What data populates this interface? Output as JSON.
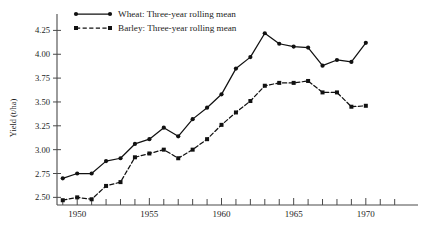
{
  "chart_data": {
    "type": "line",
    "title": "",
    "xlabel": "",
    "ylabel": "Yield (t/ha)",
    "xlim": [
      1948.6,
      1973.2
    ],
    "ylim": [
      2.42,
      4.38
    ],
    "grid": false,
    "legend_position": "top-left",
    "x": [
      1949,
      1950,
      1951,
      1952,
      1953,
      1954,
      1955,
      1956,
      1957,
      1958,
      1959,
      1960,
      1961,
      1962,
      1963,
      1964,
      1965,
      1966,
      1967,
      1968,
      1969,
      1970
    ],
    "xticks_major": [
      1950,
      1955,
      1960,
      1965,
      1970
    ],
    "xticks_major_labels": [
      "1950",
      "1955",
      "1960",
      "1965",
      "1970"
    ],
    "xticks_minor": [
      1949,
      1951,
      1952,
      1953,
      1954,
      1956,
      1957,
      1958,
      1959,
      1961,
      1962,
      1963,
      1964,
      1966,
      1967,
      1968,
      1969,
      1971,
      1972
    ],
    "yticks": [
      2.5,
      2.75,
      3.0,
      3.25,
      3.5,
      3.75,
      4.0,
      4.25
    ],
    "ytick_labels": [
      "2.50",
      "2.75",
      "3.00",
      "3.25",
      "3.50",
      "3.75",
      "4.00",
      "4.25"
    ],
    "series": [
      {
        "name": "Wheat: Three-year rolling mean",
        "style": "solid",
        "marker": "filled-circle",
        "color": "#111111",
        "values": [
          2.7,
          2.75,
          2.75,
          2.88,
          2.91,
          3.06,
          3.11,
          3.23,
          3.14,
          3.32,
          3.44,
          3.58,
          3.85,
          3.97,
          4.22,
          4.11,
          4.08,
          4.07,
          3.88,
          3.94,
          3.92,
          4.12
        ]
      },
      {
        "name": "Barley: Three-year rolling mean",
        "style": "dashed",
        "marker": "filled-square",
        "color": "#111111",
        "values": [
          2.47,
          2.5,
          2.48,
          2.62,
          2.66,
          2.92,
          2.96,
          3.0,
          2.91,
          3.0,
          3.11,
          3.26,
          3.39,
          3.51,
          3.67,
          3.7,
          3.7,
          3.72,
          3.6,
          3.6,
          3.45,
          3.46
        ]
      }
    ]
  },
  "legend": {
    "entries": [
      {
        "label": "Wheat: Three-year rolling mean",
        "style": "solid"
      },
      {
        "label": "Barley: Three-year rolling mean",
        "style": "dashed"
      }
    ]
  },
  "axes": {
    "y_title": "Yield (t/ha)"
  }
}
